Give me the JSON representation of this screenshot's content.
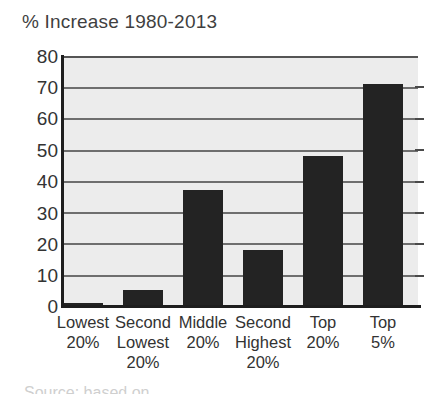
{
  "chart_data": {
    "type": "bar",
    "title": "% Increase 1980-2013",
    "xlabel": "",
    "ylabel": "",
    "ylim": [
      0,
      80
    ],
    "yticks": [
      0,
      10,
      20,
      30,
      40,
      50,
      60,
      70,
      80
    ],
    "grid": true,
    "legend": null,
    "bar_color": "#232323",
    "plot_background": "#ececec",
    "categories": [
      "Lowest 20%",
      "Second Lowest 20%",
      "Middle 20%",
      "Second Highest 20%",
      "Top 20%",
      "Top 5%"
    ],
    "category_lines": [
      [
        "Lowest",
        "20%",
        ""
      ],
      [
        "Second",
        "Lowest",
        "20%"
      ],
      [
        "Middle",
        "20%",
        ""
      ],
      [
        "Second",
        "Highest",
        "20%"
      ],
      [
        "Top",
        "20%",
        ""
      ],
      [
        "Top",
        "5%",
        ""
      ]
    ],
    "values": [
      1,
      5,
      37,
      18,
      48,
      71
    ]
  },
  "footer": {
    "source_text": "Source: based on"
  }
}
